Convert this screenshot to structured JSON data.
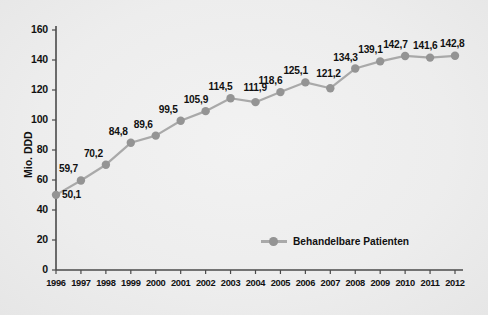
{
  "chart_data": {
    "type": "line",
    "title": "",
    "xlabel": "",
    "ylabel": "Mio. DDD",
    "ylim": [
      0,
      160
    ],
    "yticks": [
      "0",
      "20",
      "40",
      "60",
      "80",
      "100",
      "120",
      "140",
      "160"
    ],
    "ytick_values": [
      0,
      20,
      40,
      60,
      80,
      100,
      120,
      140,
      160
    ],
    "grid": false,
    "legend_position": "inside-bottom-center",
    "categories": [
      "1996",
      "1997",
      "1998",
      "1999",
      "2000",
      "2001",
      "2002",
      "2003",
      "2004",
      "2005",
      "2006",
      "2007",
      "2008",
      "2009",
      "2010",
      "2011",
      "2012"
    ],
    "series": [
      {
        "name": "Behandelbare Patienten",
        "values": [
          50.1,
          59.7,
          70.2,
          84.8,
          89.6,
          99.5,
          105.9,
          114.5,
          111.9,
          118.6,
          125.1,
          121.2,
          134.3,
          139.1,
          142.7,
          141.6,
          142.8
        ],
        "point_labels": [
          "50,1",
          "59,7",
          "70,2",
          "84,8",
          "89,6",
          "99,5",
          "105,9",
          "114,5",
          "111,9",
          "118,6",
          "125,1",
          "121,2",
          "134,3",
          "139,1",
          "142,7",
          "141,6",
          "142,8"
        ],
        "color": "#949494",
        "line_color": "#a9a9a9"
      }
    ]
  },
  "legend": {
    "entries": [
      {
        "label": "Behandelbare Patienten",
        "color": "#949494"
      }
    ]
  },
  "colors": {
    "background": "#eeeeee",
    "axis": "#4a4a4a",
    "marker": "#949494",
    "line": "#a9a9a9",
    "text": "#111111"
  }
}
